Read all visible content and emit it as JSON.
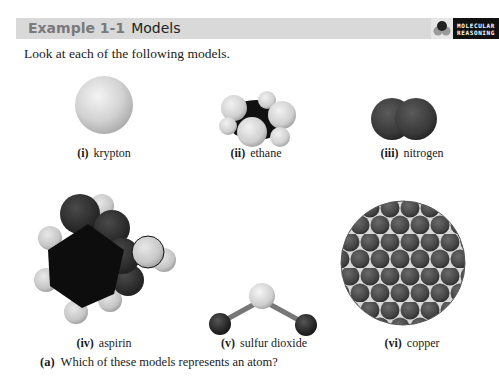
{
  "header": {
    "example_label": "Example 1-1",
    "title": "Models",
    "badge_line1": "MOLECULAR",
    "badge_line2": "REASONING",
    "bar_color": "#d9d9d9"
  },
  "intro": "Look at each of the following models.",
  "models": [
    {
      "num": "(i)",
      "name": "krypton"
    },
    {
      "num": "(ii)",
      "name": "ethane"
    },
    {
      "num": "(iii)",
      "name": "nitrogen"
    },
    {
      "num": "(iv)",
      "name": "aspirin"
    },
    {
      "num": "(v)",
      "name": "sulfur dioxide"
    },
    {
      "num": "(vi)",
      "name": "copper"
    }
  ],
  "question": {
    "label": "(a)",
    "text": "Which of these models represents an atom?"
  }
}
